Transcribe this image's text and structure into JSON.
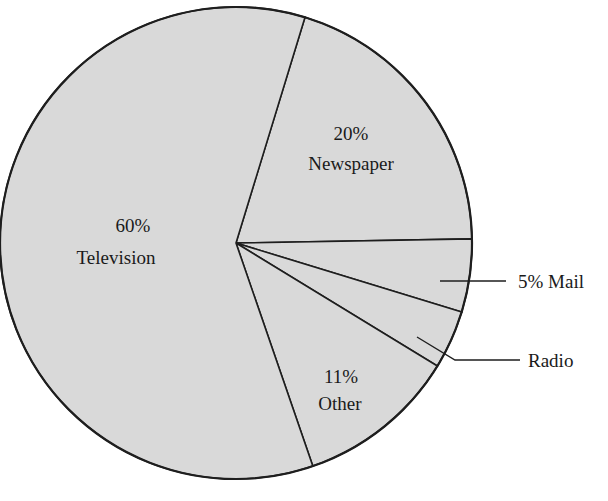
{
  "chart_data": {
    "type": "pie",
    "title": "",
    "categories": [
      "Television",
      "Newspaper",
      "Mail",
      "Radio",
      "Other"
    ],
    "values": [
      60,
      20,
      5,
      4,
      11
    ],
    "units": "%",
    "labels": {
      "television": {
        "pct": "60%",
        "name": "Television"
      },
      "newspaper": {
        "pct": "20%",
        "name": "Newspaper"
      },
      "mail": {
        "text": "5% Mail"
      },
      "radio": {
        "text": "Radio"
      },
      "other": {
        "pct": "11%",
        "name": "Other"
      }
    },
    "fill_color": "#d9d9d9",
    "stroke_color": "#1e1e1e",
    "start_angle_deg": 17,
    "direction": "clockwise",
    "legend": "none"
  }
}
